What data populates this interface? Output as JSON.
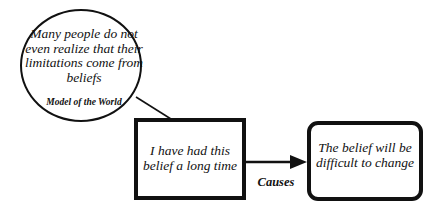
{
  "diagram": {
    "bubble": {
      "text": "Many people do not even realize that their limitations come from beliefs",
      "label": "Model of the World"
    },
    "source_node": {
      "text": "I have had this belief a long time"
    },
    "target_node": {
      "text": "The belief will be difficult to change"
    },
    "edge": {
      "label": "Causes",
      "from": "source_node",
      "to": "target_node"
    },
    "colors": {
      "stroke": "#111111",
      "background": "#ffffff"
    }
  }
}
